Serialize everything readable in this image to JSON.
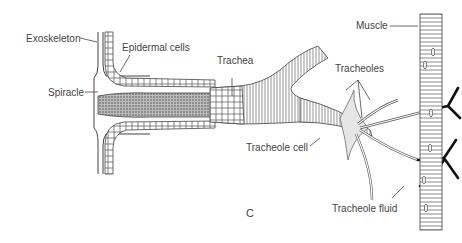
{
  "diagram": {
    "panel_letter": "C",
    "labels": {
      "exoskeleton": "Exoskeleton",
      "epidermal_cells": "Epidermal cells",
      "spiracle": "Spiracle",
      "trachea": "Trachea",
      "tracheoles": "Tracheoles",
      "muscle": "Muscle",
      "tracheole_cell": "Tracheole cell",
      "tracheole_fluid": "Tracheole fluid"
    },
    "colors": {
      "ink": "#333333",
      "label_text": "#444444",
      "fluid": "#111111",
      "background": "#ffffff"
    }
  }
}
